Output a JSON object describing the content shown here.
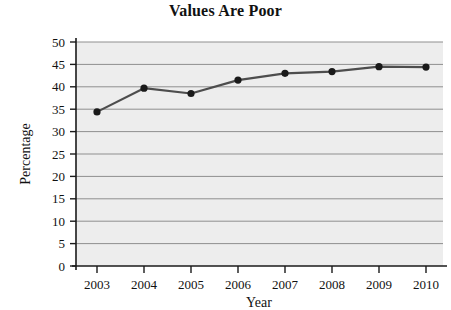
{
  "chart_data": {
    "type": "line",
    "title": "Values Are Poor",
    "xlabel": "Year",
    "ylabel": "Percentage",
    "categories": [
      "2003",
      "2004",
      "2005",
      "2006",
      "2007",
      "2008",
      "2009",
      "2010"
    ],
    "x": [
      2003,
      2004,
      2005,
      2006,
      2007,
      2008,
      2009,
      2010
    ],
    "values": [
      34.4,
      39.7,
      38.5,
      41.5,
      43.0,
      43.4,
      44.5,
      44.4
    ],
    "series": [
      {
        "name": "Percentage",
        "values": [
          34.4,
          39.7,
          38.5,
          41.5,
          43.0,
          43.4,
          44.5,
          44.4
        ]
      }
    ],
    "ylim": [
      0,
      50
    ],
    "yticks": [
      0,
      5,
      10,
      15,
      20,
      25,
      30,
      35,
      40,
      45,
      50
    ],
    "ytick_labels": [
      "0",
      "5",
      "10",
      "15",
      "20",
      "25",
      "30",
      "35",
      "40",
      "45",
      "50"
    ],
    "xticks": [
      2003,
      2004,
      2005,
      2006,
      2007,
      2008,
      2009,
      2010
    ],
    "xtick_labels": [
      "2003",
      "2004",
      "2005",
      "2006",
      "2007",
      "2008",
      "2009",
      "2010"
    ],
    "grid": "horizontal",
    "legend": "none",
    "marker": "circle",
    "colors": {
      "line": "#4d4d4d",
      "marker": "#1a1a1a",
      "plot_background": "#ededed",
      "gridline": "#8f8f8f",
      "axis": "#1a1a1a",
      "text": "#111111",
      "figure_background": "#ffffff"
    }
  }
}
